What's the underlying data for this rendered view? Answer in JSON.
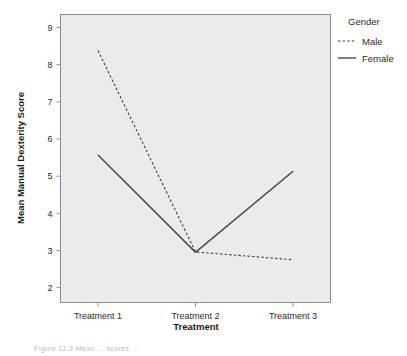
{
  "chart_data": {
    "type": "line",
    "title": "",
    "xlabel": "Treatment",
    "ylabel": "Mean Manual Dexterity Score",
    "categories": [
      "Treatment 1",
      "Treatment 2",
      "Treatment 3"
    ],
    "xtick_labels": [
      "Treatment 1",
      "Treatment 2",
      "Treatment 3"
    ],
    "ytick_labels": [
      "2",
      "3",
      "4",
      "5",
      "6",
      "7",
      "8",
      "9"
    ],
    "ylim": [
      1.6,
      9.35
    ],
    "yticks": [
      2,
      3,
      4,
      5,
      6,
      7,
      8,
      9
    ],
    "grid": false,
    "legend_position": "right",
    "legend_title": "Gender",
    "series": [
      {
        "name": "Male",
        "style": "dashed",
        "color": "#3a3a3a",
        "values": [
          8.38,
          2.96,
          2.75
        ]
      },
      {
        "name": "Female",
        "style": "solid",
        "color": "#3a3a3a",
        "values": [
          5.57,
          2.95,
          5.13
        ]
      }
    ],
    "panel_background": "#ebebeb",
    "panel_border": "#8c8c8c"
  },
  "legend": {
    "title": "Gender",
    "entries": [
      {
        "label": "Male",
        "style": "dashed"
      },
      {
        "label": "Female",
        "style": "solid"
      }
    ]
  },
  "axes": {
    "y_title": "Mean Manual Dexterity Score",
    "x_title": "Treatment",
    "y_ticks": [
      "9",
      "8",
      "7",
      "6",
      "5",
      "4",
      "3",
      "2"
    ],
    "x_ticks": [
      "Treatment 1",
      "Treatment 2",
      "Treatment 3"
    ]
  },
  "caption": {
    "fragment": "Figure  11.3    Mean  ...  scores  ..."
  }
}
